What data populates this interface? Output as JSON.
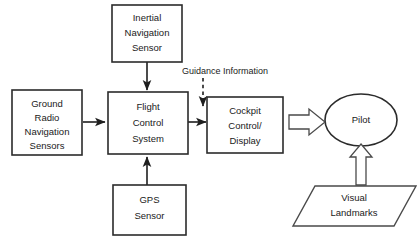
{
  "diagram": {
    "background_color": "#ffffff",
    "stroke_color": "#2b2b2b",
    "nodes": [
      {
        "id": "inertial-navigation-sensor",
        "shape": "rectangle",
        "lines": [
          "Inertial",
          "Navigation",
          "Sensor"
        ]
      },
      {
        "id": "ground-radio-navigation-sensors",
        "shape": "rectangle",
        "lines": [
          "Ground",
          "Radio",
          "Navigation",
          "Sensors"
        ]
      },
      {
        "id": "flight-control-system",
        "shape": "rectangle",
        "lines": [
          "Flight",
          "Control",
          "System"
        ]
      },
      {
        "id": "gps-sensor",
        "shape": "rectangle",
        "lines": [
          "GPS",
          "Sensor"
        ]
      },
      {
        "id": "cockpit-control-display",
        "shape": "rectangle",
        "lines": [
          "Cockpit",
          "Control/",
          "Display"
        ]
      },
      {
        "id": "pilot",
        "shape": "ellipse",
        "lines": [
          "Pilot"
        ]
      },
      {
        "id": "visual-landmarks",
        "shape": "parallelogram",
        "lines": [
          "Visual",
          "Landmarks"
        ]
      }
    ],
    "edges": [
      {
        "id": "inertial-to-flight-control",
        "from": "inertial-navigation-sensor",
        "to": "flight-control-system",
        "style": "solid",
        "label": ""
      },
      {
        "id": "ground-radio-to-flight-control",
        "from": "ground-radio-navigation-sensors",
        "to": "flight-control-system",
        "style": "solid",
        "label": ""
      },
      {
        "id": "gps-to-flight-control",
        "from": "gps-sensor",
        "to": "flight-control-system",
        "style": "solid",
        "label": ""
      },
      {
        "id": "flight-control-to-cockpit",
        "from": "flight-control-system",
        "to": "cockpit-control-display",
        "style": "solid",
        "label": ""
      },
      {
        "id": "guidance-information",
        "from": "",
        "to": "cockpit-control-display",
        "style": "dashed",
        "label": "Guidance Information"
      },
      {
        "id": "cockpit-to-pilot",
        "from": "cockpit-control-display",
        "to": "pilot",
        "style": "block-arrow",
        "label": ""
      },
      {
        "id": "visual-landmarks-to-pilot",
        "from": "visual-landmarks",
        "to": "pilot",
        "style": "block-arrow",
        "label": ""
      }
    ]
  }
}
